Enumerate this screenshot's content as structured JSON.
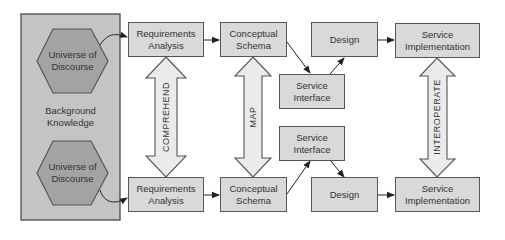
{
  "background": {
    "label_line1": "Background",
    "label_line2": "Knowledge"
  },
  "universe_top": {
    "line1": "Universe of",
    "line2": "Discourse"
  },
  "universe_bottom": {
    "line1": "Universe of",
    "line2": "Discourse"
  },
  "top_row": {
    "requirements": {
      "line1": "Requirements",
      "line2": "Analysis"
    },
    "conceptual": {
      "line1": "Conceptual",
      "line2": "Schema"
    },
    "service_interface": {
      "line1": "Service",
      "line2": "Interface"
    },
    "design": {
      "line1": "Design"
    },
    "implementation": {
      "line1": "Service",
      "line2": "Implementation"
    }
  },
  "bottom_row": {
    "requirements": {
      "line1": "Requirements",
      "line2": "Analysis"
    },
    "conceptual": {
      "line1": "Conceptual",
      "line2": "Schema"
    },
    "service_interface": {
      "line1": "Service",
      "line2": "Interface"
    },
    "design": {
      "line1": "Design"
    },
    "implementation": {
      "line1": "Service",
      "line2": "Implementation"
    }
  },
  "relations": {
    "comprehend": "COMPREHEND",
    "map": "MAP",
    "interoperate": "INTEROPERATE"
  },
  "colors": {
    "background_panel": "#c4c4c4",
    "hexagon": "#a3a3a3",
    "box": "#d9d9d9",
    "stroke": "#555555",
    "double_arrow": "#ebebeb"
  }
}
